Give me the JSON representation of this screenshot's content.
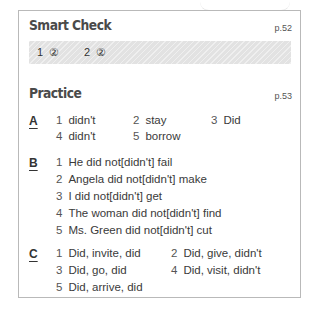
{
  "smart_check": {
    "title": "Smart Check",
    "page": "p.52",
    "answers": [
      {
        "num": "1",
        "answer": "②"
      },
      {
        "num": "2",
        "answer": "②"
      }
    ]
  },
  "practice": {
    "title": "Practice",
    "page": "p.53",
    "sections": {
      "A": {
        "label": "A",
        "items": [
          {
            "num": "1",
            "text": "didn't"
          },
          {
            "num": "2",
            "text": "stay"
          },
          {
            "num": "3",
            "text": "Did"
          },
          {
            "num": "4",
            "text": "didn't"
          },
          {
            "num": "5",
            "text": "borrow"
          }
        ]
      },
      "B": {
        "label": "B",
        "items": [
          {
            "num": "1",
            "text": "He did not[didn't] fail"
          },
          {
            "num": "2",
            "text": "Angela did not[didn't] make"
          },
          {
            "num": "3",
            "text": "I did not[didn't] get"
          },
          {
            "num": "4",
            "text": "The woman did not[didn't] find"
          },
          {
            "num": "5",
            "text": "Ms. Green did not[didn't] cut"
          }
        ]
      },
      "C": {
        "label": "C",
        "items": [
          {
            "num": "1",
            "text": "Did, invite, did"
          },
          {
            "num": "2",
            "text": "Did, give, didn't"
          },
          {
            "num": "3",
            "text": "Did, go, did"
          },
          {
            "num": "4",
            "text": "Did, visit, didn't"
          },
          {
            "num": "5",
            "text": "Did, arrive, did"
          }
        ]
      }
    }
  }
}
